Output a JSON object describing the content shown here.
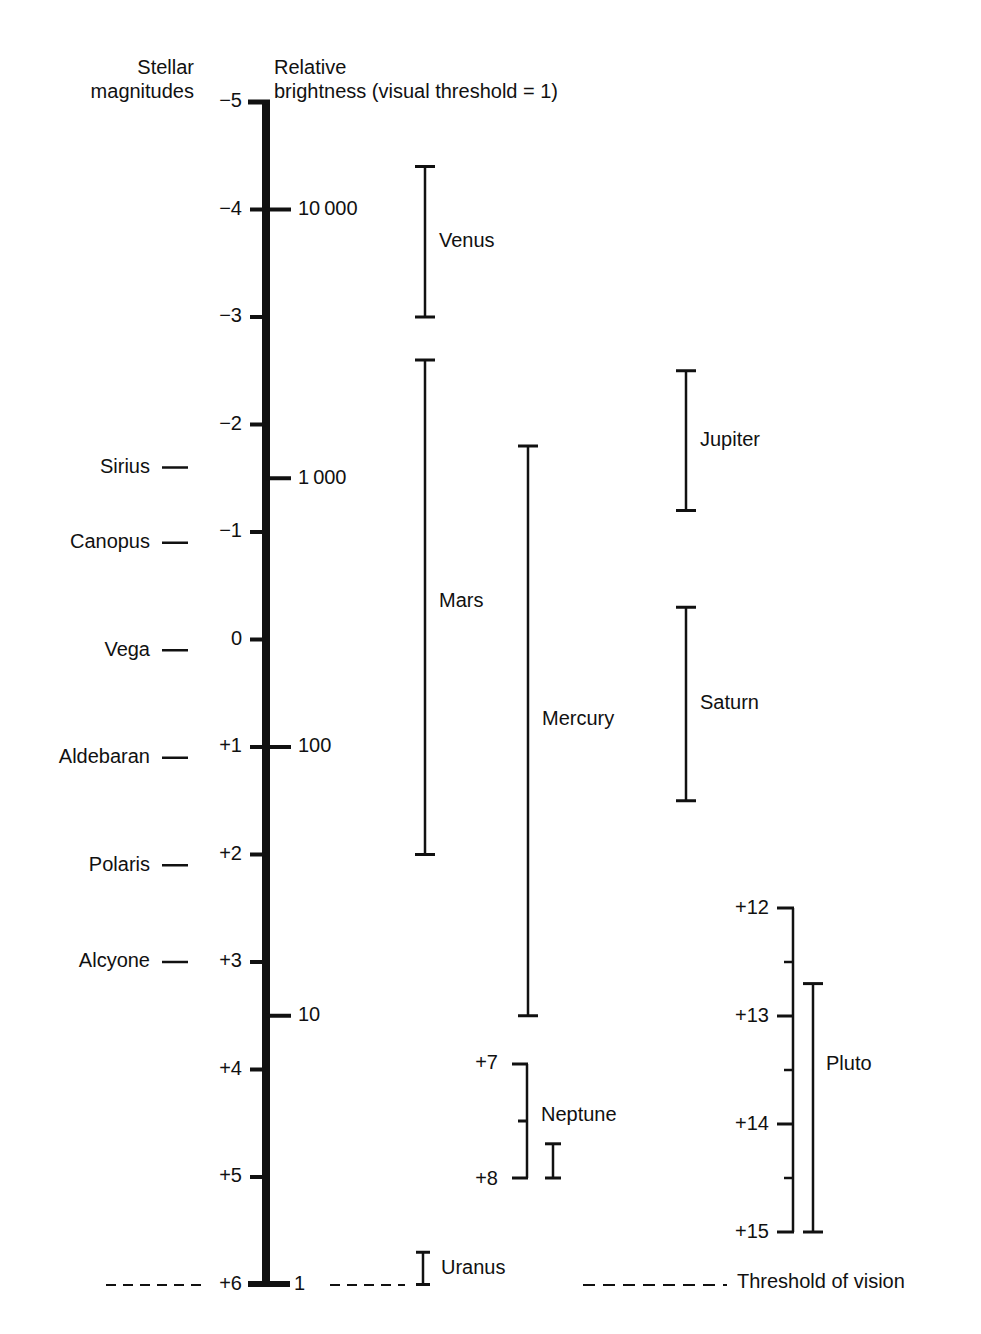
{
  "header": {
    "stellar_line1": "Stellar",
    "stellar_line2": "magnitudes",
    "relative_line1": "Relative",
    "relative_line2": "brightness (visual threshold = 1)"
  },
  "threshold_label": "Threshold of vision",
  "colors": {
    "ink": "#111111",
    "background": "#ffffff"
  },
  "chart_data": {
    "type": "range",
    "title": "",
    "ylabel_left": "Stellar magnitudes",
    "ylabel_right": "Relative brightness (visual threshold = 1)",
    "ylim": [
      -5,
      6
    ],
    "y_inverted": true,
    "grid": false,
    "magnitude_ticks": [
      {
        "value": -5,
        "label": "−5"
      },
      {
        "value": -4,
        "label": "−4"
      },
      {
        "value": -3,
        "label": "−3"
      },
      {
        "value": -2,
        "label": "−2"
      },
      {
        "value": -1,
        "label": "−1"
      },
      {
        "value": 0,
        "label": "0"
      },
      {
        "value": 1,
        "label": "+1"
      },
      {
        "value": 2,
        "label": "+2"
      },
      {
        "value": 3,
        "label": "+3"
      },
      {
        "value": 4,
        "label": "+4"
      },
      {
        "value": 5,
        "label": "+5"
      },
      {
        "value": 6,
        "label": "+6"
      }
    ],
    "brightness_ticks": [
      {
        "magnitude": -4.0,
        "label": "10 000"
      },
      {
        "magnitude": -1.5,
        "label": "1 000"
      },
      {
        "magnitude": 1.0,
        "label": "100"
      },
      {
        "magnitude": 3.5,
        "label": "10"
      },
      {
        "magnitude": 6.0,
        "label": "1"
      }
    ],
    "stars": [
      {
        "name": "Sirius",
        "magnitude": -1.6
      },
      {
        "name": "Canopus",
        "magnitude": -0.9
      },
      {
        "name": "Vega",
        "magnitude": 0.1
      },
      {
        "name": "Aldebaran",
        "magnitude": 1.1
      },
      {
        "name": "Polaris",
        "magnitude": 2.1
      },
      {
        "name": "Alcyone",
        "magnitude": 3.0
      }
    ],
    "planets": [
      {
        "name": "Venus",
        "min": -4.4,
        "max": -3.0,
        "x": 425,
        "label_y": -3.7
      },
      {
        "name": "Mars",
        "min": -2.6,
        "max": 2.0,
        "x": 425,
        "label_y": -0.35
      },
      {
        "name": "Mercury",
        "min": -1.8,
        "max": 3.5,
        "x": 528,
        "label_y": 0.75
      },
      {
        "name": "Jupiter",
        "min": -2.5,
        "max": -1.2,
        "x": 686,
        "label_y": -1.85
      },
      {
        "name": "Saturn",
        "min": -0.3,
        "max": 1.5,
        "x": 686,
        "label_y": 0.6
      },
      {
        "name": "Uranus",
        "min": 5.7,
        "max": 6.0,
        "x": 423,
        "label_y": 5.85
      }
    ],
    "neptune_inset": {
      "name": "Neptune",
      "scale_min": 7,
      "scale_max": 8,
      "tick_labels": [
        "+7",
        "+8"
      ],
      "min": 7.7,
      "max": 8.0
    },
    "pluto_inset": {
      "name": "Pluto",
      "scale_min": 12,
      "scale_max": 15,
      "tick_labels": [
        "+12",
        "+13",
        "+14",
        "+15"
      ],
      "min": 12.7,
      "max": 15.0
    },
    "threshold_magnitude": 6
  }
}
